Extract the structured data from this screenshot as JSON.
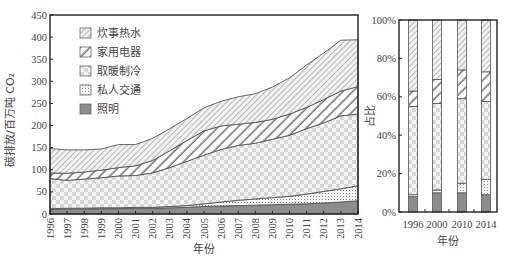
{
  "chart_data": [
    {
      "type": "area",
      "stacked": true,
      "title": "",
      "xlabel": "年份",
      "ylabel": "碳排放/百万吨 CO₂",
      "ylim": [
        0,
        450
      ],
      "yticks": [
        0,
        50,
        100,
        150,
        200,
        250,
        300,
        350,
        400,
        450
      ],
      "x": [
        "1996",
        "1997",
        "1998",
        "1999",
        "2000",
        "2001",
        "2002",
        "2003",
        "2004",
        "2005",
        "2006",
        "2007",
        "2008",
        "2009",
        "2010",
        "2011",
        "2012",
        "2013",
        "2014"
      ],
      "legend_position": "upper left",
      "series": [
        {
          "name": "照明",
          "values": [
            10,
            11,
            11,
            12,
            12,
            13,
            13,
            14,
            15,
            17,
            18,
            19,
            20,
            21,
            22,
            23,
            25,
            27,
            30
          ]
        },
        {
          "name": "私人交通",
          "values": [
            2,
            2,
            2,
            2,
            2,
            2,
            2,
            3,
            4,
            6,
            9,
            12,
            14,
            16,
            18,
            22,
            26,
            30,
            34
          ]
        },
        {
          "name": "取暖制冷",
          "values": [
            68,
            63,
            66,
            68,
            72,
            72,
            78,
            88,
            100,
            110,
            119,
            124,
            126,
            132,
            138,
            148,
            155,
            165,
            162
          ]
        },
        {
          "name": "家用电器",
          "values": [
            13,
            16,
            16,
            17,
            19,
            22,
            28,
            38,
            47,
            55,
            53,
            48,
            47,
            45,
            48,
            48,
            53,
            56,
            62
          ]
        },
        {
          "name": "炊事热水",
          "values": [
            55,
            53,
            50,
            48,
            52,
            48,
            50,
            50,
            50,
            52,
            56,
            62,
            65,
            73,
            82,
            96,
            105,
            115,
            106
          ]
        }
      ],
      "totals": [
        148,
        145,
        145,
        147,
        157,
        157,
        171,
        193,
        216,
        240,
        255,
        265,
        272,
        287,
        308,
        337,
        364,
        393,
        394
      ]
    },
    {
      "type": "bar",
      "stacked": true,
      "normalized": true,
      "title": "",
      "xlabel": "年份",
      "ylabel": "占比",
      "ylim": [
        0,
        100
      ],
      "yticks": [
        "0%",
        "20%",
        "40%",
        "60%",
        "80%",
        "100%"
      ],
      "categories": [
        "1996",
        "2000",
        "2010",
        "2014"
      ],
      "series": [
        {
          "name": "照明",
          "values": [
            8,
            10,
            10,
            9
          ]
        },
        {
          "name": "私人交通",
          "values": [
            1,
            1.5,
            5,
            8
          ]
        },
        {
          "name": "取暖制冷",
          "values": [
            46,
            45,
            44,
            40.5
          ]
        },
        {
          "name": "家用电器",
          "values": [
            8,
            12.5,
            15,
            15.5
          ]
        },
        {
          "name": "炊事热水",
          "values": [
            37,
            31,
            26,
            27
          ]
        }
      ]
    }
  ],
  "legend": [
    {
      "label": "炊事热水",
      "pattern": "diag-thin"
    },
    {
      "label": "家用电器",
      "pattern": "diag-thick"
    },
    {
      "label": "取暖制冷",
      "pattern": "checker"
    },
    {
      "label": "私人交通",
      "pattern": "dots"
    },
    {
      "label": "照明",
      "pattern": "solid-gray"
    }
  ],
  "left": {
    "xlabel": "年份",
    "ylabel": "碳排放/百万吨 CO₂"
  },
  "right": {
    "xlabel": "年份",
    "ylabel": "占比"
  },
  "colors": {
    "axis": "#222222",
    "outline": "#555555",
    "lighting": "#8c8c8c",
    "text": "#444444"
  }
}
